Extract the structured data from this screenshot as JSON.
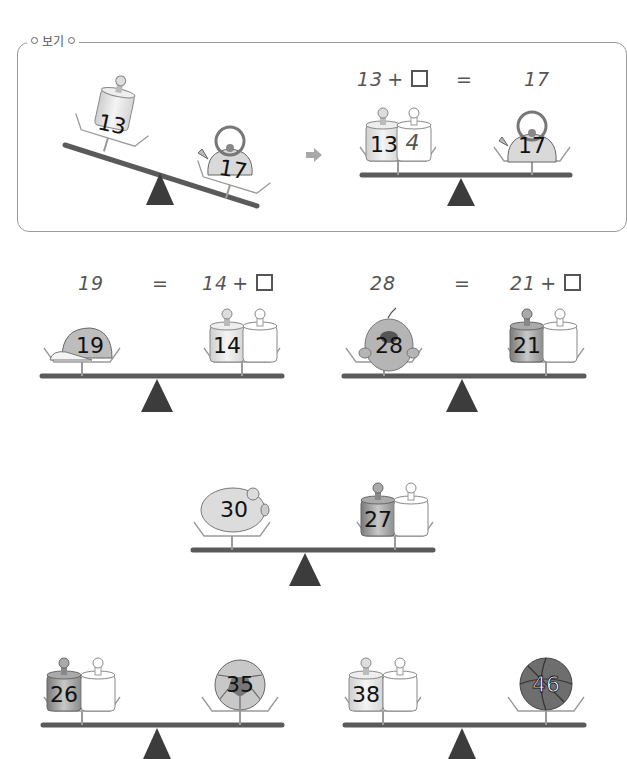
{
  "example": {
    "label": "보기",
    "left_number": "13",
    "right_number": "17",
    "equation_left": "13",
    "equation_plus": "+",
    "equation_equals": "=",
    "equation_right": "17",
    "answer_number": "13",
    "answer_extra": "4",
    "answer_right": "17"
  },
  "problems": [
    {
      "left_value": "19",
      "left_object": "cap",
      "equals": "=",
      "right_base": "14",
      "plus": "+",
      "right_object": "weight",
      "scale_left_num": "19",
      "scale_right_num": "14"
    },
    {
      "left_value": "28",
      "left_object": "teddy-bear",
      "equals": "=",
      "right_base": "21",
      "plus": "+",
      "right_object": "weight",
      "scale_left_num": "28",
      "scale_right_num": "21"
    },
    {
      "left_object": "piggy-bank",
      "scale_left_num": "30",
      "right_object": "weight",
      "scale_right_num": "27"
    },
    {
      "left_object": "weight",
      "scale_left_num": "26",
      "right_object": "soccer-ball",
      "scale_right_num": "35"
    },
    {
      "left_object": "weight",
      "scale_left_num": "38",
      "right_object": "basketball",
      "scale_right_num": "46"
    }
  ],
  "colors": {
    "beam": "#5a5a5a",
    "fulcrum": "#3c3c3c",
    "tray": "#9a9a9a",
    "weight_light": "#e6e6e6",
    "weight_dark": "#9c9c9c",
    "arrow": "#a8a8a8"
  }
}
